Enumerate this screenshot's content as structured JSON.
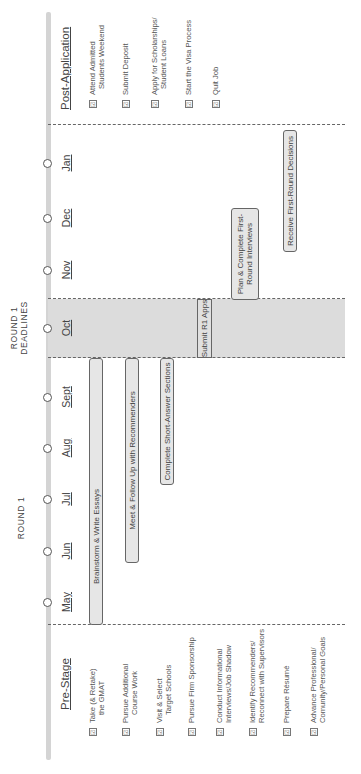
{
  "labels": {
    "round1": "ROUND 1",
    "round1_deadlines_line1": "ROUND 1",
    "round1_deadlines_line2": "DEADLINES"
  },
  "months": [
    {
      "label": "May"
    },
    {
      "label": "Jun"
    },
    {
      "label": "Jul"
    },
    {
      "label": "Aug"
    },
    {
      "label": "Sept"
    },
    {
      "label": "Oct"
    },
    {
      "label": "Nov"
    },
    {
      "label": "Dec"
    },
    {
      "label": "Jan"
    }
  ],
  "pre_stage": {
    "title": "Pre-Stage",
    "items": [
      {
        "line1": "Take (& Retake)",
        "line2": "the GMAT"
      },
      {
        "line1": "Pursue Additional",
        "line2": "Course Work"
      },
      {
        "line1": "Visit & Select",
        "line2": "Target Schools"
      },
      {
        "line1": "Pursue Firm Sponsorship",
        "line2": ""
      },
      {
        "line1": "Conduct Informational",
        "line2": "Interviews/Job Shadow"
      },
      {
        "line1": "Identify Recommenders/",
        "line2": "Reconnect with Supervisors"
      },
      {
        "line1": "Prepare Résumé",
        "line2": ""
      },
      {
        "line1": "Advance Professional/",
        "line2": "Comunity/Personal Goals"
      }
    ]
  },
  "post_application": {
    "title": "Post-Application",
    "items": [
      {
        "line1": "Attend Admitted",
        "line2": "Students Weekend"
      },
      {
        "line1": "Submit Deposit",
        "line2": ""
      },
      {
        "line1": "Apply for Scholarships/",
        "line2": "Student Loans"
      },
      {
        "line1": "Start the Visa Process",
        "line2": ""
      },
      {
        "line1": "Quit Job",
        "line2": ""
      }
    ]
  },
  "tasks": [
    {
      "label": "Brainstorm & Write Essays"
    },
    {
      "label": "Meet & Follow Up with Recommenders"
    },
    {
      "label": "Complete Short-Answer Sections"
    },
    {
      "label": "Submit R1 Apps"
    },
    {
      "line1": "Plan & Complete First-",
      "line2": "Round Interviews"
    },
    {
      "label": "Receive First-Round Decisions"
    }
  ],
  "checkbox_glyph": "☑",
  "colors": {
    "axis": "#d4d4d4",
    "band": "#dcdcdc",
    "bar_fill": "#e6e6e6",
    "bar_border": "#666666"
  }
}
